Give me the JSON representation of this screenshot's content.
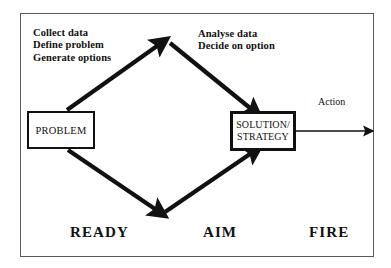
{
  "diagram": {
    "frame": {
      "border_color": "#555a5e"
    },
    "notes": [
      {
        "id": "collect",
        "lines": [
          "Collect data",
          "Define problem",
          "Generate options"
        ]
      },
      {
        "id": "analyse",
        "lines": [
          "Analyse data",
          "Decide on option"
        ]
      }
    ],
    "notes_text": {
      "collect_line1": "Collect data",
      "collect_line2": "Define problem",
      "collect_line3": "Generate options",
      "analyse_line1": "Analyse data",
      "analyse_line2": "Decide on option"
    },
    "nodes": {
      "problem": {
        "label": "PROBLEM"
      },
      "solution": {
        "line1": "SOLUTION/",
        "line2": "STRATEGY"
      }
    },
    "edge_labels": {
      "action": "Action"
    },
    "phases": {
      "ready": "READY",
      "aim": "AIM",
      "fire": "FIRE"
    },
    "colors": {
      "ink": "#111111",
      "frame": "#555a5e",
      "background": "#ffffff"
    }
  }
}
